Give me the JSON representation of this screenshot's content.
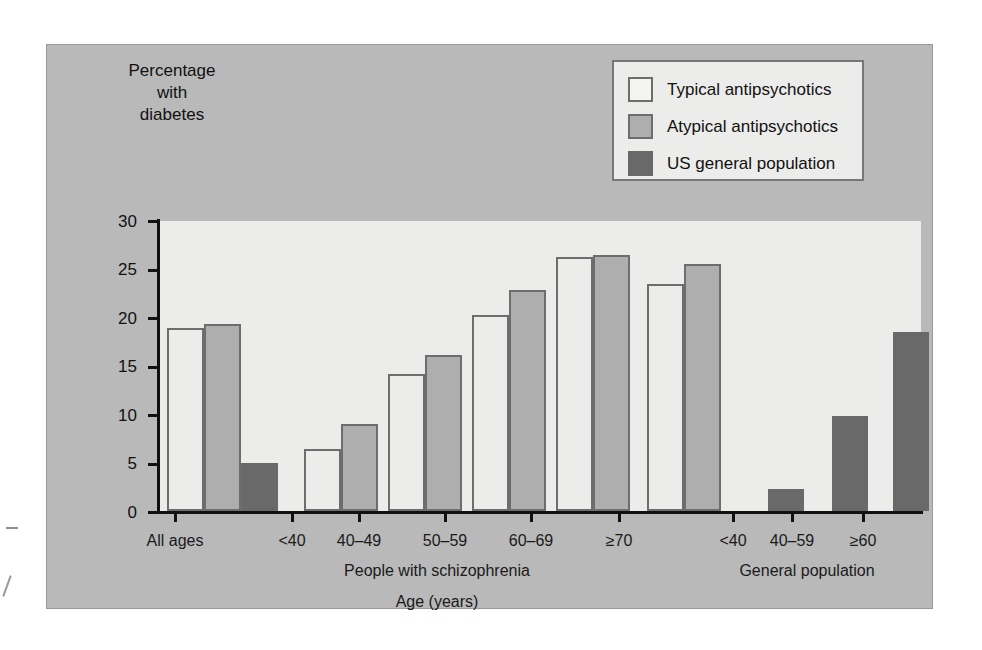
{
  "chart_data": {
    "type": "bar",
    "title": "",
    "xlabel": "Age (years)",
    "ylabel": "Percentage with diabetes",
    "ylabel_lines": [
      "Percentage",
      "with",
      "diabetes"
    ],
    "ylim": [
      0,
      30
    ],
    "yticks": [
      0,
      5,
      10,
      15,
      20,
      25,
      30
    ],
    "grid": false,
    "legend_position": "top-right",
    "categories": [
      "All ages",
      "<40",
      "40–49",
      "50–59",
      "60–69",
      "≥70",
      "<40",
      "40–59",
      "≥60"
    ],
    "series": [
      {
        "name": "Typical antipsychotics",
        "color": "#ececeb",
        "values": [
          18.9,
          6.4,
          14.1,
          20.2,
          26.2,
          23.4,
          null,
          null,
          null
        ]
      },
      {
        "name": "Atypical antipsychotics",
        "color": "#aeaeae",
        "values": [
          19.3,
          9.0,
          16.1,
          22.8,
          26.4,
          25.5,
          null,
          null,
          null
        ]
      },
      {
        "name": "US general population",
        "color": "#696969",
        "values": [
          5.0,
          null,
          null,
          null,
          null,
          null,
          2.3,
          9.8,
          18.5
        ]
      }
    ],
    "group_labels": [
      {
        "text": "People with schizophrenia",
        "spans": [
          "<40",
          "40–49",
          "50–59",
          "60–69",
          "≥70"
        ]
      },
      {
        "text": "General population",
        "spans": [
          "<40",
          "40–59",
          "≥60"
        ]
      }
    ],
    "bars": [
      {
        "cluster": "All ages",
        "series": "Typical antipsychotics",
        "value": 18.9,
        "x": 120,
        "w": 37
      },
      {
        "cluster": "All ages",
        "series": "Atypical antipsychotics",
        "value": 19.3,
        "x": 157,
        "w": 37
      },
      {
        "cluster": "All ages",
        "series": "US general population",
        "value": 5.0,
        "x": 194,
        "w": 37
      },
      {
        "cluster": "<40",
        "series": "Typical antipsychotics",
        "value": 6.4,
        "x": 257,
        "w": 37
      },
      {
        "cluster": "<40",
        "series": "Atypical antipsychotics",
        "value": 9.0,
        "x": 294,
        "w": 37
      },
      {
        "cluster": "40–49",
        "series": "Typical antipsychotics",
        "value": 14.1,
        "x": 341,
        "w": 37
      },
      {
        "cluster": "40–49",
        "series": "Atypical antipsychotics",
        "value": 16.1,
        "x": 378,
        "w": 37
      },
      {
        "cluster": "50–59",
        "series": "Typical antipsychotics",
        "value": 20.2,
        "x": 425,
        "w": 37
      },
      {
        "cluster": "50–59",
        "series": "Atypical antipsychotics",
        "value": 22.8,
        "x": 462,
        "w": 37
      },
      {
        "cluster": "60–69",
        "series": "Typical antipsychotics",
        "value": 26.2,
        "x": 509,
        "w": 37
      },
      {
        "cluster": "60–69",
        "series": "Atypical antipsychotics",
        "value": 26.4,
        "x": 546,
        "w": 37
      },
      {
        "cluster": "≥70",
        "series": "Typical antipsychotics",
        "value": 23.4,
        "x": 600,
        "w": 37
      },
      {
        "cluster": "≥70",
        "series": "Atypical antipsychotics",
        "value": 25.5,
        "x": 637,
        "w": 37
      },
      {
        "cluster": "gp-<40",
        "series": "US general population",
        "value": 2.3,
        "x": 721,
        "w": 36
      },
      {
        "cluster": "gp-40–59",
        "series": "US general population",
        "value": 9.8,
        "x": 785,
        "w": 36
      },
      {
        "cluster": "gp-≥60",
        "series": "US general population",
        "value": 18.5,
        "x": 846,
        "w": 36
      }
    ],
    "xtick_positions": [
      128,
      245,
      312,
      398,
      484,
      572,
      686,
      745,
      816
    ],
    "group_label_positions": [
      {
        "x": 390,
        "y": 517
      },
      {
        "x": 760,
        "y": 517
      }
    ]
  },
  "legend": {
    "entries": [
      {
        "label": "Typical antipsychotics",
        "swatch": "typical"
      },
      {
        "label": "Atypical antipsychotics",
        "swatch": "atypical"
      },
      {
        "label": "US general population",
        "swatch": "general"
      }
    ]
  },
  "colors": {
    "panel_background": "#b9b9b9",
    "plot_background": "#ececeb",
    "bar_typical": "#ececeb",
    "bar_atypical": "#aeaeae",
    "bar_general": "#696969",
    "bar_outline": "#6d6d6d",
    "axis": "#111111"
  }
}
